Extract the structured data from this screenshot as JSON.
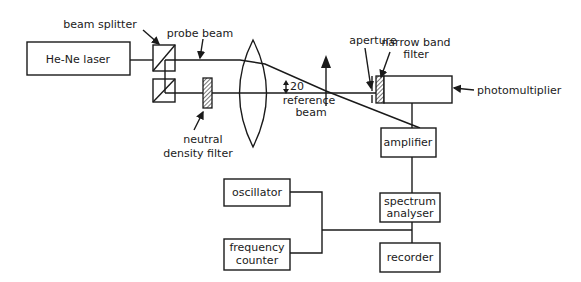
{
  "diagram": {
    "components": {
      "laser": {
        "label": "He-Ne laser"
      },
      "beam_splitter": {
        "label": "beam splitter"
      },
      "probe_beam": {
        "label": "probe beam"
      },
      "nd_filter": {
        "label_line1": "neutral",
        "label_line2": "density filter"
      },
      "angle": {
        "label": "20"
      },
      "reference_beam": {
        "label_line1": "reference",
        "label_line2": "beam"
      },
      "aperture": {
        "label": "aperture"
      },
      "narrow_band_filter": {
        "label_line1": "narrow band",
        "label_line2": "filter"
      },
      "photomultiplier": {
        "label": "photomultiplier"
      },
      "amplifier": {
        "label": "amplifier"
      },
      "spectrum_analyser": {
        "label_line1": "spectrum",
        "label_line2": "analyser"
      },
      "recorder": {
        "label": "recorder"
      },
      "oscillator": {
        "label": "oscillator"
      },
      "frequency_counter": {
        "label_line1": "frequency",
        "label_line2": "counter"
      }
    }
  }
}
